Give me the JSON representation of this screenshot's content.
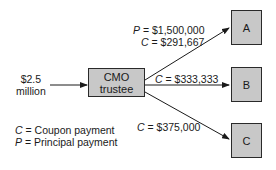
{
  "diagram": {
    "input": {
      "amount_line1": "$2.5",
      "amount_line2": "million"
    },
    "trustee": {
      "line1": "CMO",
      "line2": "trustee"
    },
    "tranches": [
      {
        "id": "A",
        "label": "A",
        "flows": [
          {
            "var": "P",
            "value": "= $1,500,000"
          },
          {
            "var": "C",
            "value": "= $291,667"
          }
        ]
      },
      {
        "id": "B",
        "label": "B",
        "flows": [
          {
            "var": "C",
            "value": "= $333,333"
          }
        ]
      },
      {
        "id": "C",
        "label": "C",
        "flows": [
          {
            "var": "C",
            "value": "= $375,000"
          }
        ]
      }
    ],
    "legend": [
      {
        "var": "C",
        "text": "= Coupon payment"
      },
      {
        "var": "P",
        "text": "= Principal payment"
      }
    ],
    "colors": {
      "box_fill": "#c8c8c8",
      "stroke": "#2a2a2a"
    }
  }
}
